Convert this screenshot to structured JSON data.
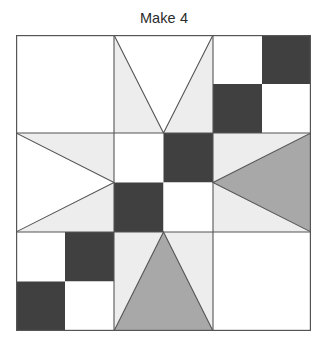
{
  "figure": {
    "title": "Make 4",
    "kind": "quilt-block-diagram",
    "grid": {
      "rows": 3,
      "cols": 3
    }
  },
  "colors": {
    "background": "#ffffff",
    "white_fabric": "#ffffff",
    "light_fabric": "#ededed",
    "medium_fabric": "#a8a8a8",
    "dark_fabric": "#404040",
    "outline": "#555555",
    "title_text": "#2b2b2b"
  },
  "units": [
    {
      "id": "unit-r1c1",
      "row": 1,
      "col": 1,
      "name": "plain-square",
      "fabrics": [
        "white_fabric"
      ]
    },
    {
      "id": "unit-r1c2",
      "row": 1,
      "col": 2,
      "name": "flying-geese-down",
      "fabrics": [
        "white_fabric",
        "light_fabric"
      ]
    },
    {
      "id": "unit-r1c3",
      "row": 1,
      "col": 3,
      "name": "four-patch",
      "fabrics": [
        "white_fabric",
        "dark_fabric",
        "dark_fabric",
        "white_fabric"
      ]
    },
    {
      "id": "unit-r2c1",
      "row": 2,
      "col": 1,
      "name": "flying-geese-right",
      "fabrics": [
        "white_fabric",
        "light_fabric"
      ]
    },
    {
      "id": "unit-r2c2",
      "row": 2,
      "col": 2,
      "name": "four-patch",
      "fabrics": [
        "white_fabric",
        "dark_fabric",
        "dark_fabric",
        "white_fabric"
      ]
    },
    {
      "id": "unit-r2c3",
      "row": 2,
      "col": 3,
      "name": "flying-geese-left",
      "fabrics": [
        "medium_fabric",
        "light_fabric"
      ]
    },
    {
      "id": "unit-r3c1",
      "row": 3,
      "col": 1,
      "name": "four-patch",
      "fabrics": [
        "white_fabric",
        "dark_fabric",
        "dark_fabric",
        "white_fabric"
      ]
    },
    {
      "id": "unit-r3c2",
      "row": 3,
      "col": 2,
      "name": "flying-geese-up",
      "fabrics": [
        "medium_fabric",
        "light_fabric"
      ]
    },
    {
      "id": "unit-r3c3",
      "row": 3,
      "col": 3,
      "name": "plain-square",
      "fabrics": [
        "white_fabric"
      ]
    }
  ]
}
